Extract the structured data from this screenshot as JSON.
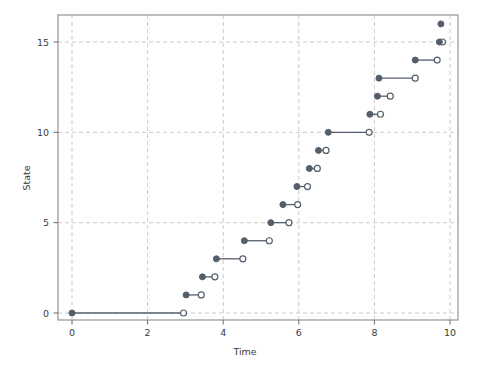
{
  "chart_data": {
    "type": "line",
    "title": "",
    "xlabel": "Time",
    "ylabel": "State",
    "xlim": [
      0,
      10.1
    ],
    "ylim": [
      -0.6,
      16.6
    ],
    "xticks": [
      0,
      2,
      4,
      6,
      8,
      10
    ],
    "xtick_labels": [
      "0",
      "2",
      "4",
      "6",
      "8",
      "10"
    ],
    "yticks": [
      0,
      5,
      10,
      15
    ],
    "ytick_labels": [
      "0",
      "5",
      "10",
      "15"
    ],
    "grid": true,
    "grid_style": "dashed",
    "legend": "none",
    "series_name": "state-trajectory",
    "marker_filled": "closed-circle-start",
    "marker_open": "open-circle-end",
    "line_color": "#555f6b",
    "marker_fill_color": "#555f6b",
    "marker_open_fill": "#ffffff",
    "grid_color": "#bdbdbd",
    "axis_color": "#8a8a8a",
    "segments": [
      {
        "state": 0,
        "t_start": 0.0,
        "t_end": 2.95
      },
      {
        "state": 1,
        "t_start": 3.02,
        "t_end": 3.42
      },
      {
        "state": 2,
        "t_start": 3.45,
        "t_end": 3.78
      },
      {
        "state": 3,
        "t_start": 3.82,
        "t_end": 4.52
      },
      {
        "state": 4,
        "t_start": 4.56,
        "t_end": 5.22
      },
      {
        "state": 5,
        "t_start": 5.26,
        "t_end": 5.74
      },
      {
        "state": 6,
        "t_start": 5.58,
        "t_end": 5.97
      },
      {
        "state": 7,
        "t_start": 5.95,
        "t_end": 6.23
      },
      {
        "state": 8,
        "t_start": 6.28,
        "t_end": 6.49
      },
      {
        "state": 9,
        "t_start": 6.52,
        "t_end": 6.72
      },
      {
        "state": 10,
        "t_start": 6.78,
        "t_end": 7.86
      },
      {
        "state": 11,
        "t_start": 7.88,
        "t_end": 8.16
      },
      {
        "state": 12,
        "t_start": 8.08,
        "t_end": 8.42
      },
      {
        "state": 13,
        "t_start": 8.12,
        "t_end": 9.08
      },
      {
        "state": 14,
        "t_start": 9.08,
        "t_end": 9.66
      },
      {
        "state": 15,
        "t_start": 9.72,
        "t_end": 9.8
      },
      {
        "state": 16,
        "t_start": 9.76,
        "t_end": 9.76
      }
    ]
  }
}
